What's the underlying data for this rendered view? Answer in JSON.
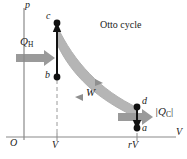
{
  "figure": {
    "title": "Otto cycle",
    "axes": {
      "y_label": "p",
      "x_label": "V",
      "origin_label": "O"
    },
    "x_ticks": [
      {
        "label": "V",
        "x": 57
      },
      {
        "label": "rV",
        "x": 137
      }
    ],
    "points": [
      {
        "label": "c",
        "x": 57,
        "y": 23
      },
      {
        "label": "b",
        "x": 57,
        "y": 77
      },
      {
        "label": "d",
        "x": 137,
        "y": 107
      },
      {
        "label": "a",
        "x": 137,
        "y": 128
      }
    ],
    "work_label": "W",
    "heat_in": {
      "label": "Q",
      "subscript": "H"
    },
    "heat_out": {
      "label": "|Q",
      "subscript": "C",
      "tail": "|"
    },
    "colors": {
      "axis": "#8a8a8a",
      "curve_fill": "#b5b5b5",
      "stroke": "#111111",
      "arrow_gray": "#9a9a9a",
      "dashed": "#9a9a9a"
    }
  }
}
